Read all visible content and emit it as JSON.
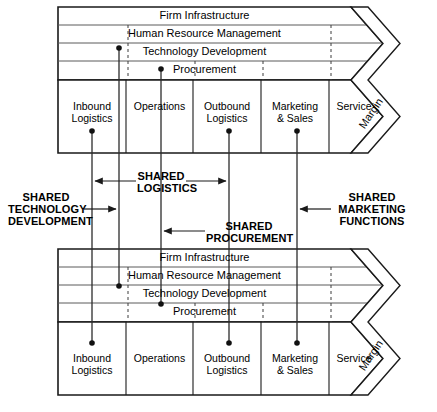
{
  "diagram": {
    "support_activities": [
      "Firm Infrastructure",
      "Human Resource Management",
      "Technology Development",
      "Procurement"
    ],
    "primary_activities": [
      "Inbound\nLogistics",
      "Operations",
      "Outbound\nLogistics",
      "Marketing\n& Sales",
      "Service"
    ],
    "primary_activities_lines": [
      [
        "Inbound",
        "Logistics"
      ],
      [
        "Operations",
        ""
      ],
      [
        "Outbound",
        "Logistics"
      ],
      [
        "Marketing",
        "& Sales"
      ],
      [
        "Service",
        ""
      ]
    ],
    "margin_label": "Margin",
    "annotations": [
      {
        "id": "shared-logistics",
        "lines": [
          "SHARED",
          "LOGISTICS"
        ]
      },
      {
        "id": "shared-technology-development",
        "lines": [
          "SHARED",
          "TECHNOLOGY",
          "DEVELOPMENT"
        ]
      },
      {
        "id": "shared-procurement",
        "lines": [
          "SHARED",
          "PROCUREMENT"
        ]
      },
      {
        "id": "shared-marketing-functions",
        "lines": [
          "SHARED",
          "MARKETING",
          "FUNCTIONS"
        ]
      }
    ],
    "chains": [
      {
        "id": "upper-value-chain",
        "position": "top"
      },
      {
        "id": "lower-value-chain",
        "position": "bottom"
      }
    ],
    "colors": {
      "outline": "#1a1a1a",
      "inner_rule": "#5a5a5a",
      "dashed": "#3c3c3c",
      "connector": "#2b2b2b",
      "background": "#ffffff"
    }
  }
}
